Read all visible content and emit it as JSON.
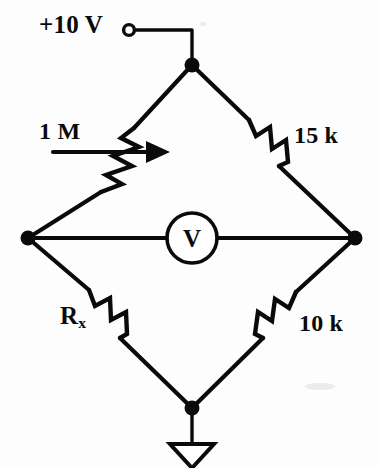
{
  "diagram": {
    "ink_color": "#0a0a0a",
    "background_color": "#fdfdfd"
  },
  "supply": {
    "label": "+10 V",
    "terminal_icon": "open-terminal-circle"
  },
  "components": {
    "potentiometer": {
      "label": "1 M",
      "value": "1 M",
      "symbol": "potentiometer-zigzag-with-wiper-arrow",
      "branch": "top-left"
    },
    "resistor_top_right": {
      "label": "15 k",
      "value": "15 k",
      "symbol": "resistor-zigzag",
      "branch": "top-right"
    },
    "resistor_bottom_left": {
      "label": "R",
      "subscript": "x",
      "value": "Rx",
      "symbol": "resistor-zigzag",
      "branch": "bottom-left"
    },
    "resistor_bottom_right": {
      "label": "10 k",
      "value": "10 k",
      "symbol": "resistor-zigzag",
      "branch": "bottom-right"
    },
    "voltmeter": {
      "label": "V",
      "symbol": "voltmeter-circle",
      "position": "bridge-center"
    },
    "ground": {
      "symbol": "ground-triangle",
      "position": "bottom-node"
    }
  },
  "nodes": {
    "top": "top-node",
    "left": "left-node",
    "right": "right-node",
    "bottom": "bottom-node"
  }
}
